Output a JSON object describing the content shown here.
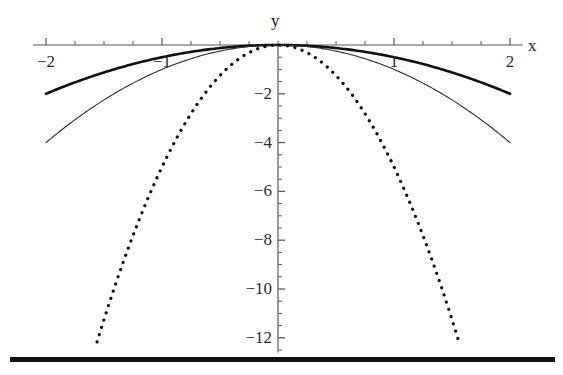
{
  "chart_data": {
    "type": "line",
    "title": "",
    "subtitle": "",
    "xlabel": "x",
    "ylabel": "y",
    "xlim": [
      -2,
      2
    ],
    "ylim": [
      -12.6,
      0.6
    ],
    "grid": false,
    "legend": "none",
    "x_ticks_major": [
      -2,
      -1,
      1,
      2
    ],
    "x_tick_labels": [
      "-2",
      "-1",
      "1",
      "2"
    ],
    "x_tick_minor_step": 0.25,
    "y_ticks_major": [
      -2,
      -4,
      -6,
      -8,
      -10,
      -12
    ],
    "y_tick_labels": [
      "-2",
      "-4",
      "-6",
      "-8",
      "-10",
      "-12"
    ],
    "y_tick_minor_step": 0.5,
    "axes_origin": [
      0,
      0
    ],
    "series": [
      {
        "name": "y = -x^2/2",
        "style": "solid-thick",
        "color": "#111111",
        "linewidth": 2.6,
        "coefficient": -0.5,
        "x_range": [
          -2,
          2
        ],
        "x": [
          -2,
          -1.75,
          -1.5,
          -1.25,
          -1,
          -0.75,
          -0.5,
          -0.25,
          0,
          0.25,
          0.5,
          0.75,
          1,
          1.25,
          1.5,
          1.75,
          2
        ],
        "values": [
          -2,
          -1.531,
          -1.125,
          -0.781,
          -0.5,
          -0.281,
          -0.125,
          -0.031,
          0,
          -0.031,
          -0.125,
          -0.281,
          -0.5,
          -0.781,
          -1.125,
          -1.531,
          -2
        ]
      },
      {
        "name": "y = -x^2",
        "style": "solid-thin",
        "color": "#2e2e2e",
        "linewidth": 1.1,
        "coefficient": -1,
        "x_range": [
          -2,
          2
        ],
        "x": [
          -2,
          -1.75,
          -1.5,
          -1.25,
          -1,
          -0.75,
          -0.5,
          -0.25,
          0,
          0.25,
          0.5,
          0.75,
          1,
          1.25,
          1.5,
          1.75,
          2
        ],
        "values": [
          -4,
          -3.063,
          -2.25,
          -1.563,
          -1,
          -0.563,
          -0.25,
          -0.063,
          0,
          -0.063,
          -0.25,
          -0.563,
          -1,
          -1.563,
          -2.25,
          -3.063,
          -4
        ]
      },
      {
        "name": "y = -5x^2",
        "style": "dotted",
        "color": "#111111",
        "linewidth": 3.2,
        "coefficient": -5,
        "x_range": [
          -1.56,
          1.56
        ],
        "x": [
          -1.56,
          -1.35,
          -1.15,
          -0.95,
          -0.75,
          -0.55,
          -0.35,
          -0.15,
          0,
          0.15,
          0.35,
          0.55,
          0.75,
          0.95,
          1.15,
          1.35,
          1.56
        ],
        "values": [
          -12.17,
          -9.11,
          -6.61,
          -4.51,
          -2.81,
          -1.51,
          -0.61,
          -0.11,
          0,
          -0.11,
          -0.61,
          -1.51,
          -2.81,
          -4.51,
          -6.61,
          -9.11,
          -12.17
        ]
      }
    ],
    "annotations": [
      {
        "name": "baseline-bar",
        "description": "thick solid horizontal rule below plot"
      }
    ]
  },
  "axis": {
    "x_label": "x",
    "y_label": "y"
  },
  "colors": {
    "axis": "#5a5a5a",
    "curve_thick": "#111111",
    "curve_thin": "#2e2e2e",
    "curve_dotted": "#111111",
    "baseline": "#111111",
    "background": "#ffffff",
    "tick_text": "#2b2b2b"
  }
}
